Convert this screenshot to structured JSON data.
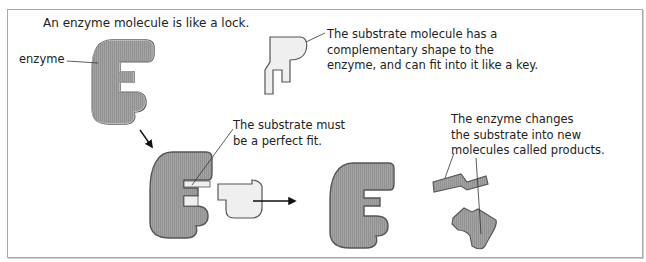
{
  "diagram": {
    "title": "An enzyme molecule is like a lock.",
    "labels": {
      "enzyme": "enzyme",
      "substrate": [
        "The substrate molecule has a",
        "complementary shape to the",
        "enzyme, and can fit into it like a key."
      ],
      "perfect_fit": [
        "The substrate must",
        "be a perfect fit."
      ],
      "products": [
        "The enzyme changes",
        "the substrate into new",
        "molecules called products."
      ]
    },
    "stages": [
      "enzyme alone",
      "substrate alone",
      "enzyme-substrate complex",
      "enzyme released",
      "products"
    ],
    "colors": {
      "enzyme_fill": "#9a9a9a",
      "substrate_fill": "#efefef",
      "outline": "#555555",
      "border": "#a9a9a9"
    }
  }
}
